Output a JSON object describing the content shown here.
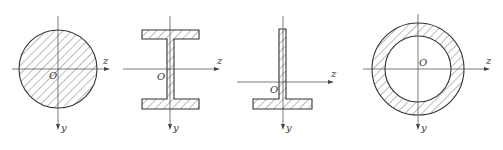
{
  "diagram": {
    "colors": {
      "stroke": "#333333",
      "hatch": "#555555",
      "background": "#ffffff"
    },
    "figures": [
      {
        "id": "solid-circle",
        "shape": "solid circular section",
        "origin_label": "O",
        "z_label": "z",
        "y_label": "y"
      },
      {
        "id": "i-beam",
        "shape": "I-section (symmetric I-beam)",
        "origin_label": "O",
        "z_label": "z",
        "y_label": "y"
      },
      {
        "id": "t-section",
        "shape": "inverted T-section",
        "origin_label": "O",
        "z_label": "z",
        "y_label": "y"
      },
      {
        "id": "hollow-circle",
        "shape": "hollow circular (annular) section",
        "origin_label": "O",
        "z_label": "z",
        "y_label": "y"
      }
    ]
  }
}
